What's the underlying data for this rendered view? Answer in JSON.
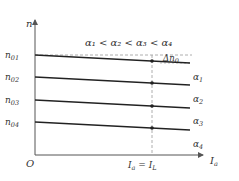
{
  "diagram": {
    "y_axis_label": "n",
    "x_axis_label": "I",
    "x_axis_label_sub": "a",
    "origin_label": "O",
    "condition_text": "α₁ < α₂ < α₃ < α₄",
    "delta_label": "Δn",
    "delta_label_sub": "0",
    "operating_point_label": "I",
    "operating_point_sub_a": "a",
    "operating_point_eq": " = I",
    "operating_point_sub_l": "L",
    "lines": [
      {
        "start_label": "n",
        "start_sub": "01",
        "end_label": "α",
        "end_sub": "1"
      },
      {
        "start_label": "n",
        "start_sub": "02",
        "end_label": "α",
        "end_sub": "2"
      },
      {
        "start_label": "n",
        "start_sub": "03",
        "end_label": "α",
        "end_sub": "3"
      },
      {
        "start_label": "n",
        "start_sub": "04",
        "end_label": "α",
        "end_sub": "4"
      }
    ],
    "colors": {
      "line": "#222222",
      "axis": "#555555",
      "dashed": "#999999",
      "text": "#333333"
    }
  }
}
